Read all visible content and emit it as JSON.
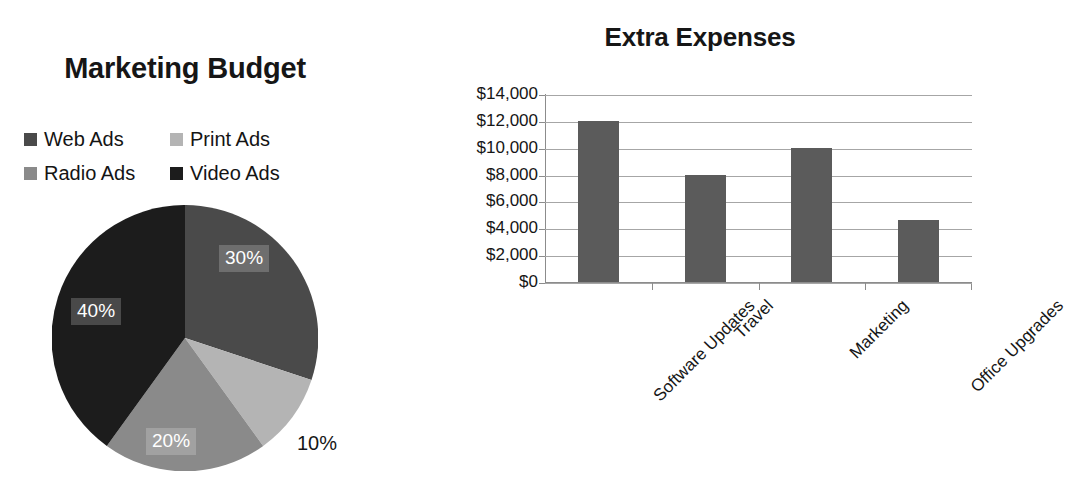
{
  "pie_chart": {
    "title": "Marketing Budget",
    "legend": [
      {
        "label": "Web Ads",
        "color": "#4a4a4a",
        "swatch_name": "legend-swatch-web-ads"
      },
      {
        "label": "Print Ads",
        "color": "#b4b4b4",
        "swatch_name": "legend-swatch-print-ads"
      },
      {
        "label": "Radio Ads",
        "color": "#8a8a8a",
        "swatch_name": "legend-swatch-radio-ads"
      },
      {
        "label": "Video Ads",
        "color": "#1c1c1c",
        "swatch_name": "legend-swatch-video-ads"
      }
    ],
    "labels": {
      "web": "30%",
      "print": "10%",
      "radio": "20%",
      "video": "40%"
    }
  },
  "bar_chart": {
    "title": "Extra Expenses"
  },
  "chart_data": [
    {
      "type": "pie",
      "title": "Marketing Budget",
      "categories": [
        "Web Ads",
        "Print Ads",
        "Radio Ads",
        "Video Ads"
      ],
      "values": [
        30,
        10,
        20,
        40
      ],
      "value_labels": [
        "30%",
        "10%",
        "20%",
        "40%"
      ],
      "colors": [
        "#4a4a4a",
        "#b4b4b4",
        "#8a8a8a",
        "#1c1c1c"
      ],
      "units": "percent",
      "start_angle": 0,
      "direction": "clockwise",
      "legend": "top",
      "label_position": [
        "inside",
        "outside",
        "inside",
        "inside"
      ]
    },
    {
      "type": "bar",
      "title": "Extra Expenses",
      "categories": [
        "Software Updates",
        "Travel",
        "Marketing",
        "Office Upgrades"
      ],
      "values": [
        12000,
        8000,
        10000,
        4600
      ],
      "xlabel": "",
      "ylabel": "",
      "ylim": [
        0,
        14000
      ],
      "ytick_values": [
        14000,
        12000,
        10000,
        8000,
        6000,
        4000,
        2000,
        0
      ],
      "ytick_labels": [
        "$14,000",
        "$12,000",
        "$10,000",
        "$8,000",
        "$6,000",
        "$4,000",
        "$2,000",
        "$0"
      ],
      "grid": true,
      "grid_axis": "y",
      "legend": "none",
      "bar_color": "#5b5b5b",
      "xtick_label_rotation": -45
    }
  ]
}
